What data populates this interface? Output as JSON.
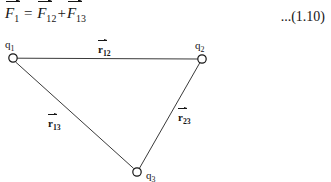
{
  "equation": {
    "terms": [
      {
        "symbol": "F",
        "subscript": "1",
        "vector": true
      },
      {
        "operator": "="
      },
      {
        "symbol": "F",
        "subscript": "12",
        "vector": true
      },
      {
        "operator": "+"
      },
      {
        "symbol": "F",
        "subscript": "13",
        "vector": true
      }
    ],
    "lhs_symbol": "F",
    "lhs_subscript": "1",
    "equals": "=",
    "rhs1_symbol": "F",
    "rhs1_subscript": "12",
    "plus": "+",
    "rhs2_symbol": "F",
    "rhs2_subscript": "13",
    "number": "...(1.10)"
  },
  "diagram": {
    "type": "vector-triangle",
    "line_color": "#3a3a3a",
    "node_color": "#151515",
    "background": "#ffffff",
    "nodes": [
      {
        "id": "q1",
        "symbol": "q",
        "subscript": "1",
        "x": 13,
        "y": 28,
        "r": 4.2
      },
      {
        "id": "q2",
        "symbol": "q",
        "subscript": "2",
        "x": 202,
        "y": 29,
        "r": 4.2
      },
      {
        "id": "q3",
        "symbol": "q",
        "subscript": "3",
        "x": 137,
        "y": 142,
        "r": 4.2
      }
    ],
    "edges": [
      {
        "id": "r12",
        "from": "q1",
        "to": "q2",
        "symbol": "r",
        "subscript": "12"
      },
      {
        "id": "r13",
        "from": "q1",
        "to": "q3",
        "symbol": "r",
        "subscript": "13"
      },
      {
        "id": "r23",
        "from": "q2",
        "to": "q3",
        "symbol": "r",
        "subscript": "23"
      }
    ],
    "node_labels": {
      "q1": {
        "symbol": "q",
        "subscript": "1"
      },
      "q2": {
        "symbol": "q",
        "subscript": "2"
      },
      "q3": {
        "symbol": "q",
        "subscript": "3"
      }
    },
    "edge_labels": {
      "r12": {
        "symbol": "r",
        "subscript": "12"
      },
      "r13": {
        "symbol": "r",
        "subscript": "13"
      },
      "r23": {
        "symbol": "r",
        "subscript": "23"
      }
    }
  }
}
